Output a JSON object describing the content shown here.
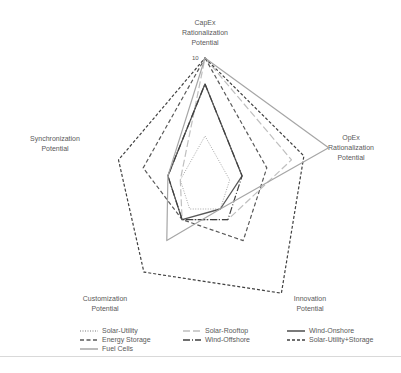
{
  "chart_data": {
    "type": "radar",
    "title": "",
    "axes": [
      [
        "CapEx",
        "Rationalization",
        "Potential"
      ],
      [
        "OpEx",
        "Rationalization",
        "Potential"
      ],
      [
        "Innovation",
        "Potential"
      ],
      [
        "Customization",
        "Potential"
      ],
      [
        "Synchronization",
        "Potential"
      ]
    ],
    "range": [
      0,
      10
    ],
    "tick_label": "10",
    "grid": false,
    "legend_position": "bottom",
    "series": [
      {
        "name": "Solar-Utility",
        "values": [
          4,
          2,
          2,
          2,
          2
        ],
        "color": "#a6a6a6",
        "dash": "1,1.5",
        "width": 1
      },
      {
        "name": "Solar-Rooftop",
        "values": [
          10,
          7,
          3,
          3,
          2
        ],
        "color": "#bfbfbf",
        "dash": "7,3",
        "width": 1.2
      },
      {
        "name": "Wind-Onshore",
        "values": [
          8,
          3,
          2,
          3,
          3
        ],
        "color": "#595959",
        "dash": "",
        "width": 1.3
      },
      {
        "name": "Energy Storage",
        "values": [
          10,
          5,
          5,
          3,
          5
        ],
        "color": "#595959",
        "dash": "4,2.5",
        "width": 1.2
      },
      {
        "name": "Wind-Offshore",
        "values": [
          8,
          3,
          3,
          3,
          3
        ],
        "color": "#404040",
        "dash": "7,2,1,2",
        "width": 1.2
      },
      {
        "name": "Solar-Utility+Storage",
        "values": [
          10,
          8,
          10,
          8,
          7
        ],
        "color": "#404040",
        "dash": "3,2",
        "width": 1.2
      },
      {
        "name": "Fuel Cells",
        "values": [
          10,
          10,
          2,
          5,
          3
        ],
        "color": "#a6a6a6",
        "dash": "",
        "width": 1.2
      }
    ]
  }
}
